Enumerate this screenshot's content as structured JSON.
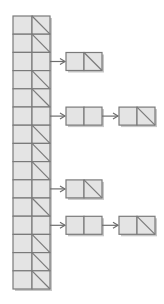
{
  "diagram": {
    "type": "hash-table-separate-chaining",
    "colors": {
      "cell_fill": "#e4e4e4",
      "cell_stroke": "#7a7a7a",
      "shadow": "#c8c8c8",
      "arrow": "#6e6e6e",
      "background": "#ffffff"
    },
    "table": {
      "x": 13,
      "y": 16,
      "row_height": 18.2,
      "key_width": 19,
      "ptr_width": 18,
      "row_count": 15
    },
    "buckets": [
      {
        "index": 0,
        "null": true,
        "chain_length": 0
      },
      {
        "index": 1,
        "null": true,
        "chain_length": 0
      },
      {
        "index": 2,
        "null": false,
        "chain_length": 1
      },
      {
        "index": 3,
        "null": true,
        "chain_length": 0
      },
      {
        "index": 4,
        "null": true,
        "chain_length": 0
      },
      {
        "index": 5,
        "null": false,
        "chain_length": 2
      },
      {
        "index": 6,
        "null": true,
        "chain_length": 0
      },
      {
        "index": 7,
        "null": true,
        "chain_length": 0
      },
      {
        "index": 8,
        "null": true,
        "chain_length": 0
      },
      {
        "index": 9,
        "null": false,
        "chain_length": 1
      },
      {
        "index": 10,
        "null": true,
        "chain_length": 0
      },
      {
        "index": 11,
        "null": false,
        "chain_length": 2
      },
      {
        "index": 12,
        "null": true,
        "chain_length": 0
      },
      {
        "index": 13,
        "null": true,
        "chain_length": 0
      },
      {
        "index": 14,
        "null": true,
        "chain_length": 0
      }
    ],
    "node": {
      "cell_width": 18,
      "height": 18,
      "first_x": 66,
      "second_x": 119
    }
  }
}
